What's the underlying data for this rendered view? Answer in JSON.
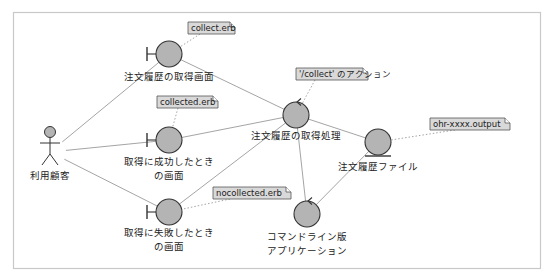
{
  "diagram": {
    "type": "UML robustness diagram",
    "colors": {
      "frame": "#c8c8c8",
      "node_fill": "#b4b4b4",
      "node_stroke": "#333333",
      "link": "#9a9a9a",
      "note_fill": "#d9d9d9",
      "note_stroke": "#555555",
      "note_link": "#9a9a9a",
      "text": "#222222"
    },
    "actor": {
      "id": "customer",
      "label": "利用顧客"
    },
    "nodes": [
      {
        "id": "history-screen",
        "kind": "boundary",
        "label_lines": [
          "注文履歴の取得画面"
        ]
      },
      {
        "id": "success-screen",
        "kind": "boundary",
        "label_lines": [
          "取得に成功したとき",
          "の画面"
        ]
      },
      {
        "id": "failure-screen",
        "kind": "boundary",
        "label_lines": [
          "取得に失敗したとき",
          "の画面"
        ]
      },
      {
        "id": "fetch-process",
        "kind": "control",
        "label_lines": [
          "注文履歴の取得処理"
        ]
      },
      {
        "id": "history-file",
        "kind": "entity",
        "label_lines": [
          "注文履歴ファイル"
        ]
      },
      {
        "id": "cli-app",
        "kind": "control",
        "label_lines": [
          "コマンドライン版",
          "アプリケーション"
        ]
      }
    ],
    "notes": [
      {
        "id": "note-collect",
        "text": "collect.erb",
        "attached_to": "history-screen"
      },
      {
        "id": "note-collected",
        "text": "collected.erb",
        "attached_to": "success-screen"
      },
      {
        "id": "note-action",
        "text": "'/collect' のアクション",
        "attached_to": "fetch-process"
      },
      {
        "id": "note-output",
        "text": "ohr-xxxx.output",
        "attached_to": "history-file"
      },
      {
        "id": "note-nocollected",
        "text": "nocollected.erb",
        "attached_to": "failure-screen"
      }
    ],
    "links": [
      [
        "customer",
        "history-screen"
      ],
      [
        "customer",
        "success-screen"
      ],
      [
        "customer",
        "failure-screen"
      ],
      [
        "history-screen",
        "fetch-process"
      ],
      [
        "success-screen",
        "fetch-process"
      ],
      [
        "failure-screen",
        "fetch-process"
      ],
      [
        "fetch-process",
        "history-file"
      ],
      [
        "fetch-process",
        "cli-app"
      ],
      [
        "history-file",
        "cli-app"
      ]
    ]
  }
}
